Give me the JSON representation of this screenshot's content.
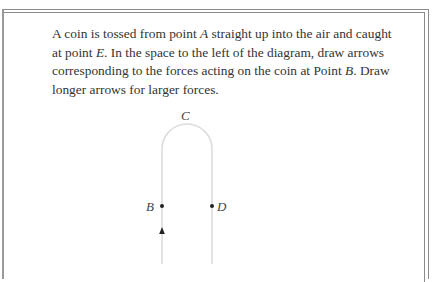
{
  "problem": {
    "text_parts": [
      "A coin is tossed from point ",
      "A",
      " straight up into the air and caught at point ",
      "E",
      ". In the space to the left of the diagram, draw arrows corresponding to the forces acting on the coin at Point ",
      "B",
      ". Draw longer arrows for larger forces."
    ]
  },
  "diagram": {
    "labels": {
      "C": "C",
      "B": "B",
      "D": "D"
    },
    "path_color": "#dcdcdc",
    "point_color": "#222222",
    "arrow_direction": "up"
  }
}
